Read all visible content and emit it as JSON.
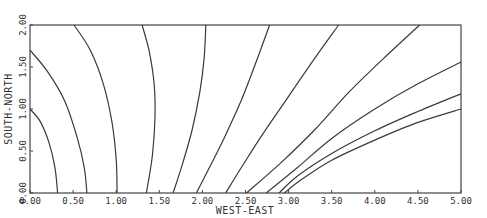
{
  "chart_data": {
    "type": "line",
    "subtype": "contour",
    "title": "",
    "xlabel": "WEST-EAST",
    "ylabel": "SOUTH-NORTH",
    "xlim": [
      0,
      5
    ],
    "ylim": [
      0,
      2
    ],
    "grid": false,
    "x_ticks": [
      "0.00",
      "0.50",
      "1.00",
      "1.50",
      "2.00",
      "2.50",
      "3.00",
      "3.50",
      "4.00",
      "4.50",
      "5.00"
    ],
    "x_tick_values": [
      0,
      0.5,
      1,
      1.5,
      2,
      2.5,
      3,
      3.5,
      4,
      4.5,
      5
    ],
    "y_ticks": [
      "0.00",
      "0.50",
      "1.00",
      "1.50",
      "2.00"
    ],
    "y_tick_values": [
      0,
      0.5,
      1,
      1.5,
      2
    ],
    "series": [
      {
        "name": "contour-1",
        "points": [
          [
            0,
            1.0
          ],
          [
            0.12,
            0.85
          ],
          [
            0.22,
            0.6
          ],
          [
            0.29,
            0.3
          ],
          [
            0.32,
            0
          ]
        ]
      },
      {
        "name": "contour-2",
        "points": [
          [
            0,
            1.7
          ],
          [
            0.2,
            1.45
          ],
          [
            0.4,
            1.1
          ],
          [
            0.55,
            0.65
          ],
          [
            0.63,
            0.3
          ],
          [
            0.66,
            0
          ]
        ]
      },
      {
        "name": "contour-3",
        "points": [
          [
            0.51,
            2.0
          ],
          [
            0.7,
            1.7
          ],
          [
            0.85,
            1.3
          ],
          [
            0.95,
            0.85
          ],
          [
            1.0,
            0.4
          ],
          [
            1.01,
            0
          ]
        ]
      },
      {
        "name": "contour-4",
        "points": [
          [
            1.3,
            2.0
          ],
          [
            1.38,
            1.7
          ],
          [
            1.44,
            1.3
          ],
          [
            1.45,
            0.9
          ],
          [
            1.42,
            0.45
          ],
          [
            1.35,
            0
          ]
        ]
      },
      {
        "name": "contour-5",
        "points": [
          [
            2.04,
            2.0
          ],
          [
            2.02,
            1.6
          ],
          [
            1.97,
            1.2
          ],
          [
            1.88,
            0.75
          ],
          [
            1.77,
            0.35
          ],
          [
            1.66,
            0
          ]
        ]
      },
      {
        "name": "contour-6",
        "points": [
          [
            2.78,
            2.0
          ],
          [
            2.62,
            1.55
          ],
          [
            2.45,
            1.1
          ],
          [
            2.25,
            0.65
          ],
          [
            2.08,
            0.3
          ],
          [
            1.93,
            0
          ]
        ]
      },
      {
        "name": "contour-7",
        "points": [
          [
            3.58,
            2.0
          ],
          [
            3.3,
            1.6
          ],
          [
            3.0,
            1.15
          ],
          [
            2.7,
            0.7
          ],
          [
            2.45,
            0.3
          ],
          [
            2.27,
            0
          ]
        ]
      },
      {
        "name": "contour-8",
        "points": [
          [
            4.52,
            2.0
          ],
          [
            4.1,
            1.6
          ],
          [
            3.7,
            1.2
          ],
          [
            3.3,
            0.75
          ],
          [
            2.9,
            0.35
          ],
          [
            2.51,
            0
          ]
        ]
      },
      {
        "name": "contour-9",
        "points": [
          [
            5.0,
            1.56
          ],
          [
            4.5,
            1.3
          ],
          [
            4.0,
            1.0
          ],
          [
            3.5,
            0.65
          ],
          [
            3.1,
            0.3
          ],
          [
            2.74,
            0
          ]
        ]
      },
      {
        "name": "contour-10",
        "points": [
          [
            5.0,
            1.18
          ],
          [
            4.5,
            0.97
          ],
          [
            4.0,
            0.74
          ],
          [
            3.5,
            0.47
          ],
          [
            3.1,
            0.2
          ],
          [
            2.89,
            0
          ]
        ]
      },
      {
        "name": "contour-11",
        "points": [
          [
            5.0,
            1.0
          ],
          [
            4.5,
            0.84
          ],
          [
            4.0,
            0.63
          ],
          [
            3.5,
            0.39
          ],
          [
            3.15,
            0.16
          ],
          [
            2.95,
            0
          ]
        ]
      }
    ]
  }
}
